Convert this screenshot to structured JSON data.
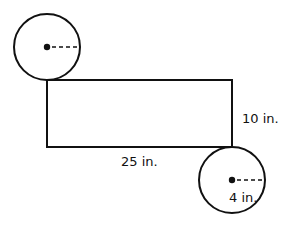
{
  "figure": {
    "type": "cylinder-net",
    "labels": {
      "height": "10 in.",
      "length": "25 in.",
      "radius": "4 in."
    },
    "colors": {
      "stroke": "#111111",
      "background": "#ffffff"
    }
  }
}
